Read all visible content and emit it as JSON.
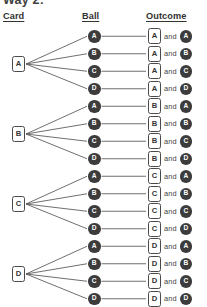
{
  "partial_title": "Way 2:",
  "headers": {
    "card": "Card",
    "ball": "Ball",
    "outcome": "Outcome"
  },
  "and_label": "and",
  "colors": {
    "ball_fill": "#3c3c3c",
    "ball_text": "#ffffff",
    "box_border": "#4a4a4a",
    "box_text": "#333333",
    "line": "#555555",
    "background": "#ffffff"
  },
  "layout": {
    "card_x": 12,
    "ball_x": 88,
    "outcome_x": 148,
    "row_height": 17.5,
    "first_row_y": 30,
    "group_size": 4
  },
  "tree": {
    "branches": [
      {
        "card": "A",
        "card_y": 56,
        "outcomes": [
          {
            "card": "A",
            "ball": "A",
            "y": 30
          },
          {
            "card": "A",
            "ball": "B",
            "y": 47.5
          },
          {
            "card": "A",
            "ball": "C",
            "y": 65
          },
          {
            "card": "A",
            "ball": "D",
            "y": 82.5
          }
        ]
      },
      {
        "card": "B",
        "card_y": 126,
        "outcomes": [
          {
            "card": "B",
            "ball": "A",
            "y": 100
          },
          {
            "card": "B",
            "ball": "B",
            "y": 117.5
          },
          {
            "card": "B",
            "ball": "C",
            "y": 135
          },
          {
            "card": "B",
            "ball": "D",
            "y": 152.5
          }
        ]
      },
      {
        "card": "C",
        "card_y": 196,
        "outcomes": [
          {
            "card": "C",
            "ball": "A",
            "y": 170
          },
          {
            "card": "C",
            "ball": "B",
            "y": 187.5
          },
          {
            "card": "C",
            "ball": "C",
            "y": 205
          },
          {
            "card": "C",
            "ball": "D",
            "y": 222.5
          }
        ]
      },
      {
        "card": "D",
        "card_y": 266,
        "outcomes": [
          {
            "card": "D",
            "ball": "A",
            "y": 240
          },
          {
            "card": "D",
            "ball": "B",
            "y": 257.5
          },
          {
            "card": "D",
            "ball": "C",
            "y": 275
          },
          {
            "card": "D",
            "ball": "D",
            "y": 292.5
          }
        ]
      }
    ]
  }
}
